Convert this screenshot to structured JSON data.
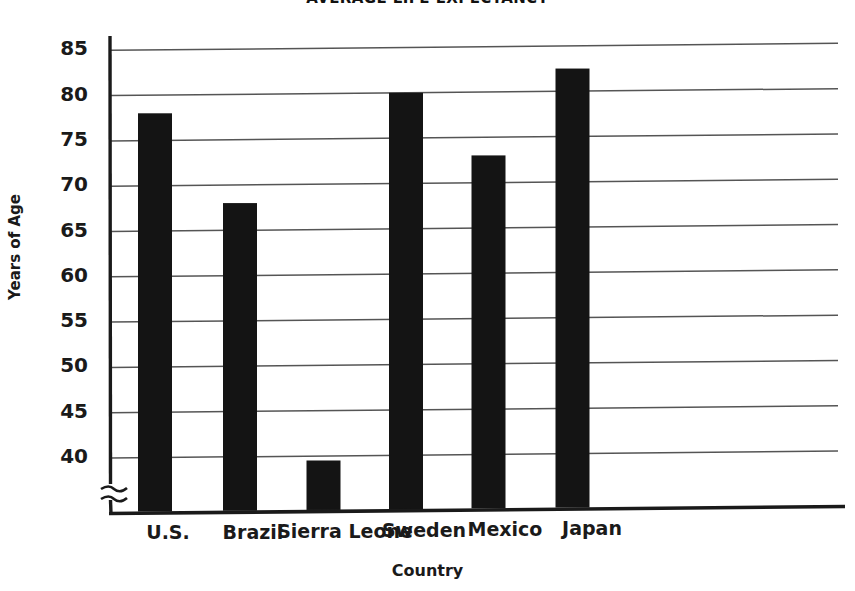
{
  "chart_data": {
    "type": "bar",
    "title": "AVERAGE LIFE EXPECTANCY",
    "xlabel": "Country",
    "ylabel": "Years of Age",
    "categories": [
      "U.S.",
      "Brazil",
      "Sierra Leone",
      "Sweden",
      "Mexico",
      "Japan"
    ],
    "values": [
      78,
      68,
      39.5,
      80,
      73,
      82.5
    ],
    "ylim": [
      37,
      86.5
    ],
    "y_ticks": [
      40,
      45,
      50,
      55,
      60,
      65,
      70,
      75,
      80,
      85
    ],
    "y_tick_labels": [
      "40",
      "45",
      "50",
      "55",
      "60",
      "65",
      "70",
      "75",
      "80",
      "85"
    ],
    "axis_break": true,
    "axis_break_note": "zigzag break on y-axis below 40",
    "grid": true,
    "grid_axis": "y",
    "legend": "none",
    "bar_color": "#141414",
    "axis_color": "#1a1a1a",
    "grid_color": "#555555",
    "background_color": "#ffffff"
  },
  "axis": {
    "y_title": "Years of Age",
    "x_title": "Country"
  }
}
